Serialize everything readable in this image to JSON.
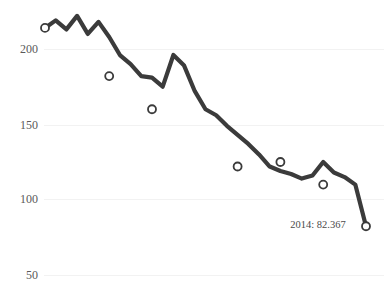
{
  "chart_data": {
    "type": "line",
    "title": "",
    "subtitle": "",
    "xlabel": "",
    "ylabel": "",
    "grid": true,
    "legend": false,
    "ylim": [
      50,
      225
    ],
    "ytick_labels": [
      "200",
      "150",
      "100",
      "50"
    ],
    "ytick_values": [
      200,
      150,
      100,
      50
    ],
    "x": [
      1984,
      1985,
      1986,
      1987,
      1988,
      1989,
      1990,
      1991,
      1992,
      1993,
      1994,
      1995,
      1996,
      1997,
      1998,
      1999,
      2000,
      2001,
      2002,
      2003,
      2004,
      2005,
      2006,
      2007,
      2008,
      2009,
      2010,
      2011,
      2012,
      2013,
      2014
    ],
    "values": [
      214,
      219,
      213,
      222,
      210,
      218,
      208,
      196,
      190,
      182,
      181,
      175,
      196,
      189,
      172,
      160,
      156,
      149,
      143,
      137,
      130,
      122,
      119,
      117,
      114,
      116,
      125,
      118,
      115,
      110,
      82.367
    ],
    "series": [
      {
        "name": "value",
        "values": [
          214,
          219,
          213,
          222,
          210,
          218,
          208,
          196,
          190,
          182,
          181,
          175,
          196,
          189,
          172,
          160,
          156,
          149,
          143,
          137,
          130,
          122,
          119,
          117,
          114,
          116,
          125,
          118,
          115,
          110,
          82.367
        ]
      }
    ],
    "markers": [
      {
        "label": "point-1",
        "x": 1984,
        "y": 214
      },
      {
        "label": "point-2",
        "x": 1990,
        "y": 182
      },
      {
        "label": "point-3",
        "x": 1994,
        "y": 160
      },
      {
        "label": "point-4",
        "x": 2002,
        "y": 122
      },
      {
        "label": "point-5",
        "x": 2006,
        "y": 125
      },
      {
        "label": "point-6",
        "x": 2010,
        "y": 110
      },
      {
        "label": "point-7",
        "x": 2014,
        "y": 82.367
      }
    ],
    "annotations": [
      {
        "text": "2014: 82.367",
        "x": 2012,
        "y": 90
      }
    ],
    "line_color": "#3b3b3b",
    "marker_fill": "#ffffff",
    "grid_color": "#f2f2f2",
    "background_color": "#ffffff",
    "tick_label_color": "#5a5a5a"
  },
  "axis": {
    "y_labels": [
      {
        "text": "200"
      },
      {
        "text": "150"
      },
      {
        "text": "100"
      },
      {
        "text": "50"
      }
    ]
  },
  "annotation": {
    "end_value_label": "2014: 82.367"
  }
}
